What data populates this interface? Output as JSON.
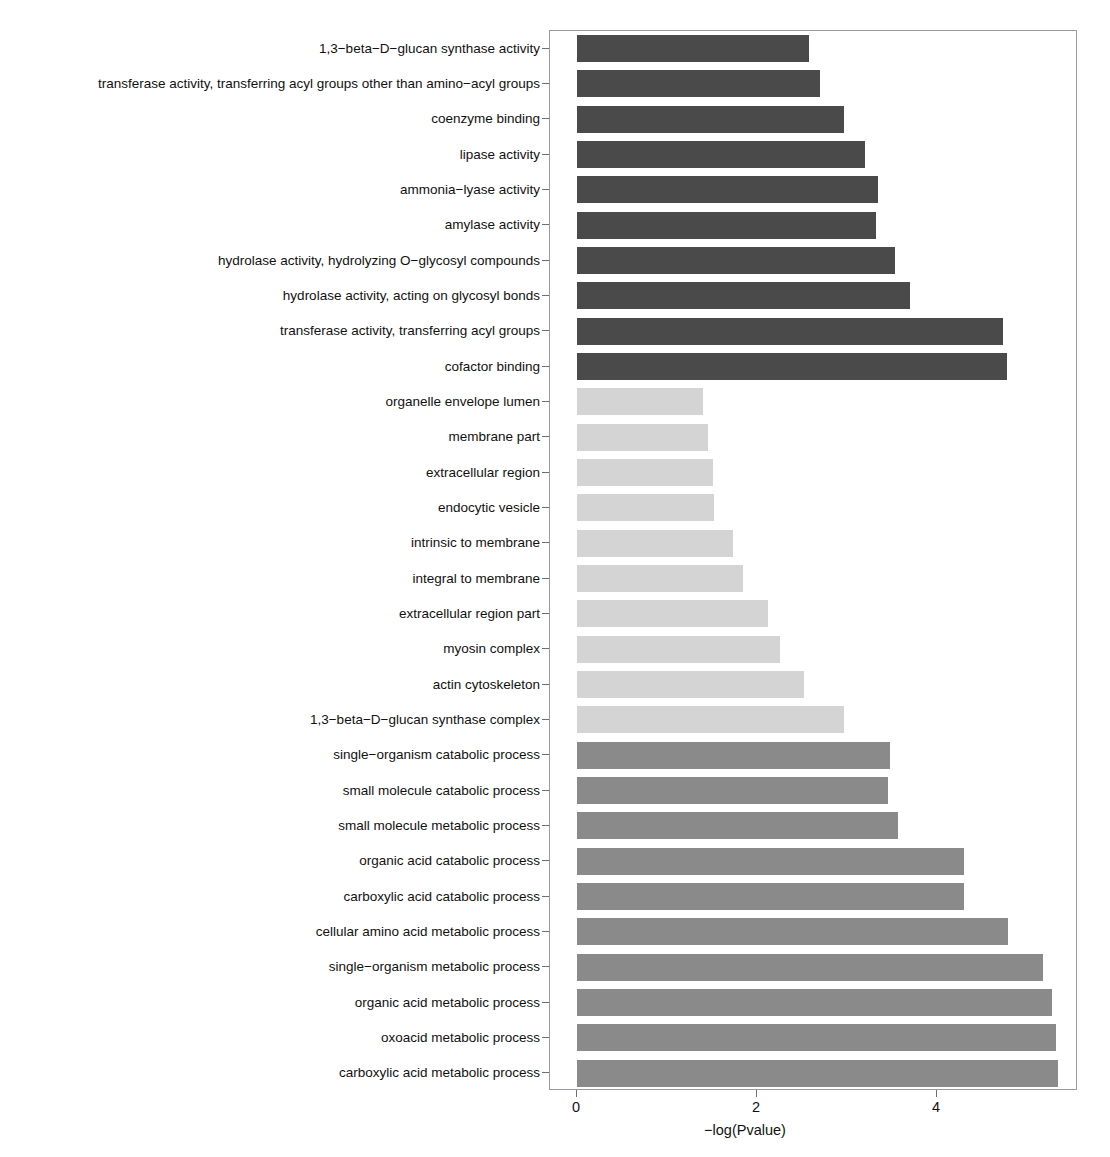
{
  "chart_data": {
    "type": "bar",
    "orientation": "horizontal",
    "title": "",
    "xlabel": "-log(Pvalue)",
    "ylabel": "",
    "xlim": [
      0,
      5.87
    ],
    "xticks": [
      0,
      2,
      4
    ],
    "xticklabels": [
      "0",
      "2",
      "4"
    ],
    "grid": false,
    "legend": "none",
    "categories": [
      "1,3-beta-D-glucan synthase activity",
      "transferase activity, transferring acyl groups other than amino-acyl groups",
      "coenzyme binding",
      "lipase activity",
      "ammonia-lyase activity",
      "amylase activity",
      "hydrolase activity, hydrolyzing O-glycosyl compounds",
      "hydrolase activity, acting on glycosyl bonds",
      "transferase activity, transferring acyl groups",
      "cofactor binding",
      "organelle envelope lumen",
      "membrane part",
      "extracellular region",
      "endocytic vesicle",
      "intrinsic to membrane",
      "integral to membrane",
      "extracellular region part",
      "myosin complex",
      "actin cytoskeleton",
      "1,3-beta-D-glucan synthase complex",
      "single-organism catabolic process",
      "small molecule catabolic process",
      "small molecule metabolic process",
      "organic acid catabolic process",
      "carboxylic acid catabolic process",
      "cellular amino acid metabolic process",
      "single-organism metabolic process",
      "organic acid metabolic process",
      "oxoacid metabolic process",
      "carboxylic acid metabolic process"
    ],
    "values": [
      2.58,
      2.7,
      2.97,
      3.2,
      3.34,
      3.32,
      3.53,
      3.7,
      4.73,
      4.78,
      1.4,
      1.45,
      1.51,
      1.52,
      1.73,
      1.84,
      2.12,
      2.25,
      2.52,
      2.97,
      3.48,
      3.45,
      3.57,
      4.3,
      4.3,
      4.79,
      5.18,
      5.28,
      5.32,
      5.34
    ],
    "groups": [
      "mf",
      "mf",
      "mf",
      "mf",
      "mf",
      "mf",
      "mf",
      "mf",
      "mf",
      "mf",
      "cc",
      "cc",
      "cc",
      "cc",
      "cc",
      "cc",
      "cc",
      "cc",
      "cc",
      "cc",
      "bp",
      "bp",
      "bp",
      "bp",
      "bp",
      "bp",
      "bp",
      "bp",
      "bp",
      "bp"
    ],
    "group_colors": {
      "mf": "#4a4a4a",
      "cc": "#d4d4d4",
      "bp": "#8a8a8a"
    },
    "panel_border_color": "#9a9a9a",
    "background": "#ffffff"
  }
}
